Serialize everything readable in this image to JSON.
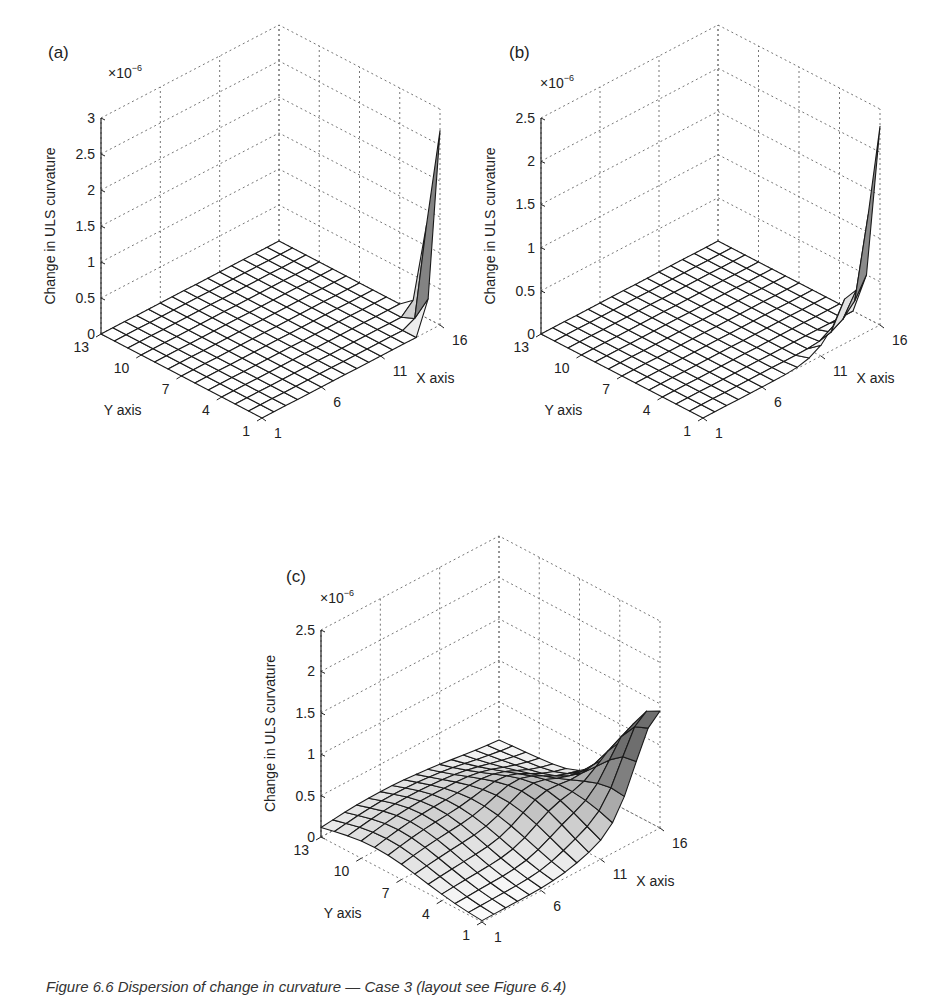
{
  "figure": {
    "caption": "Figure 6.6  Dispersion of change in curvature — Case 3 (layout see Figure 6.4)",
    "panels": [
      "(a)",
      "(b)",
      "(c)"
    ]
  },
  "chart_data": [
    {
      "type": "surface3d",
      "panel_label": "(a)",
      "title": "",
      "xlabel": "X axis",
      "ylabel": "Y axis",
      "zlabel": "Change in ULS curvature",
      "z_multiplier": "×10^-6",
      "x_ticks": [
        1,
        6,
        11,
        16
      ],
      "y_ticks": [
        1,
        4,
        7,
        10,
        13
      ],
      "z_ticks": [
        0,
        0.5,
        1,
        1.5,
        2,
        2.5,
        3
      ],
      "xlim": [
        1,
        16
      ],
      "ylim": [
        1,
        13
      ],
      "zlim": [
        0,
        3
      ],
      "grid": true,
      "description": "Flat surface (~0) everywhere except a sharp spike at the corner x=16, y=1 reaching ~2.7e-6",
      "peak": {
        "x": 16,
        "y": 1,
        "z": 2.7
      },
      "nx": 16,
      "ny": 13,
      "profile": "spike_a"
    },
    {
      "type": "surface3d",
      "panel_label": "(b)",
      "title": "",
      "xlabel": "X axis",
      "ylabel": "Y axis",
      "zlabel": "Change in ULS curvature",
      "z_multiplier": "×10^-6",
      "x_ticks": [
        1,
        6,
        11,
        16
      ],
      "y_ticks": [
        1,
        4,
        7,
        10,
        13
      ],
      "z_ticks": [
        0,
        0.5,
        1,
        1.5,
        2,
        2.5
      ],
      "xlim": [
        1,
        16
      ],
      "ylim": [
        1,
        13
      ],
      "zlim": [
        0,
        2.5
      ],
      "grid": true,
      "description": "Near-zero surface with a ridge along y=1 rising steeply toward x=16, peak ~2.3e-6",
      "peak": {
        "x": 16,
        "y": 1,
        "z": 2.3
      },
      "nx": 16,
      "ny": 13,
      "profile": "spike_b"
    },
    {
      "type": "surface3d",
      "panel_label": "(c)",
      "title": "",
      "xlabel": "X axis",
      "ylabel": "Y axis",
      "zlabel": "Change in ULS curvature",
      "z_multiplier": "×10^-6",
      "x_ticks": [
        1,
        6,
        11,
        16
      ],
      "y_ticks": [
        1,
        4,
        7,
        10,
        13
      ],
      "z_ticks": [
        0,
        0.5,
        1,
        1.5,
        2,
        2.5
      ],
      "xlim": [
        1,
        16
      ],
      "ylim": [
        1,
        13
      ],
      "zlim": [
        0,
        2.5
      ],
      "grid": true,
      "description": "Smooth broad surface ~0.3-0.5e-6 across the plate, rising to a peak ~1.4e-6 near x=16, y=1",
      "peak": {
        "x": 16,
        "y": 1,
        "z": 1.4
      },
      "nx": 16,
      "ny": 13,
      "profile": "smooth_c"
    }
  ],
  "layout": {
    "panels": [
      {
        "origin": [
          262,
          418
        ],
        "left": [
          101,
          334
        ],
        "right": [
          440,
          325
        ],
        "zpx": 216,
        "zmax": 3,
        "label_pos": [
          48,
          58
        ],
        "mult_pos": [
          108,
          78
        ]
      },
      {
        "origin": [
          703,
          418
        ],
        "left": [
          541,
          334
        ],
        "right": [
          880,
          325
        ],
        "zpx": 216,
        "zmax": 2.5,
        "label_pos": [
          509,
          58
        ],
        "mult_pos": [
          540,
          88
        ]
      },
      {
        "origin": [
          482,
          922
        ],
        "left": [
          321,
          837
        ],
        "right": [
          660,
          828
        ],
        "zpx": 207,
        "zmax": 2.5,
        "label_pos": [
          286,
          582
        ],
        "mult_pos": [
          320,
          603
        ]
      }
    ]
  }
}
